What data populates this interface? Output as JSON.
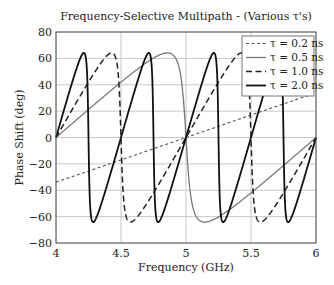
{
  "chart_data": {
    "type": "line",
    "title": "Frequency-Selective Multipath - (Various τ's)",
    "xlabel": "Frequency (GHz)",
    "ylabel": "Phase Shift (deg)",
    "xlim": [
      4,
      6
    ],
    "ylim": [
      -80,
      80
    ],
    "xticks": [
      4,
      4.5,
      5,
      5.5,
      6
    ],
    "xtick_labels": [
      "4",
      "4.5",
      "5",
      "5.5",
      "6"
    ],
    "yticks": [
      80,
      60,
      40,
      20,
      0,
      -20,
      -40,
      -60,
      -80
    ],
    "ytick_labels": [
      "80",
      "60",
      "40",
      "20",
      "0",
      "−20",
      "−40",
      "−60",
      "−80"
    ],
    "grid": true,
    "legend_position": "upper right",
    "model": "phase = atan2(a sin(2πfτ), 1 + a cos(2πfτ)), a ≈ 0.9",
    "reflection_amplitude": 0.9,
    "x": [
      4.0,
      4.25,
      4.5,
      4.75,
      5.0,
      5.25,
      5.5,
      5.75,
      6.0
    ],
    "series": [
      {
        "name": "τ = 0.2 ns",
        "legend": "τ = 0.2 ns",
        "tau": 0.2,
        "style": "dotted",
        "color": "#666666",
        "values": [
          -33.8,
          -26.0,
          -17.4,
          -8.8,
          0.0,
          8.8,
          17.4,
          26.0,
          33.8
        ]
      },
      {
        "name": "τ = 0.5 ns",
        "legend": "τ = 0.5 ns",
        "tau": 0.5,
        "style": "solid-thin",
        "color": "#777777",
        "values": [
          0.0,
          20.4,
          40.0,
          58.6,
          0.0,
          -58.6,
          -40.0,
          -20.4,
          0.0
        ]
      },
      {
        "name": "τ = 1.0 ns",
        "legend": "τ = 1.0 ns",
        "tau": 1.0,
        "style": "dashed",
        "color": "#222222",
        "values": [
          0.0,
          42.0,
          0.0,
          -42.0,
          0.0,
          42.0,
          0.0,
          -42.0,
          0.0
        ]
      },
      {
        "name": "τ = 2.0 ns",
        "legend": "τ = 2.0 ns",
        "tau": 2.0,
        "style": "solid-thick",
        "color": "#111111",
        "values": [
          0.0,
          0.0,
          0.0,
          0.0,
          0.0,
          0.0,
          0.0,
          0.0,
          0.0
        ]
      }
    ]
  }
}
